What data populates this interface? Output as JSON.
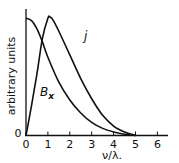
{
  "chart_data": {
    "type": "line",
    "title": "",
    "xlabel": "ν/λ.",
    "ylabel": "arbitrary units",
    "xlim": [
      0,
      6.5
    ],
    "ylim": [
      0,
      1.1
    ],
    "x_ticks": [
      "0",
      "1",
      "2",
      "3",
      "4",
      "5",
      "6"
    ],
    "y_ticks": [
      "0"
    ],
    "grid": false,
    "legend": "inline labels",
    "series": [
      {
        "name": "j",
        "label": "j",
        "x": [
          0,
          0.25,
          0.5,
          0.75,
          1.0,
          1.1,
          1.25,
          1.5,
          2.0,
          2.5,
          3.0,
          3.5,
          4.0,
          4.5,
          5.0
        ],
        "values": [
          0,
          0.25,
          0.52,
          0.82,
          0.99,
          1.0,
          0.97,
          0.88,
          0.68,
          0.48,
          0.31,
          0.17,
          0.08,
          0.03,
          0.0
        ]
      },
      {
        "name": "B_x",
        "label": "B",
        "label_subscript": "x",
        "x": [
          0,
          0.25,
          0.5,
          0.75,
          1.0,
          1.5,
          2.0,
          2.5,
          3.0,
          3.5,
          4.0,
          4.5,
          5.0
        ],
        "values": [
          0.99,
          0.97,
          0.9,
          0.79,
          0.66,
          0.45,
          0.3,
          0.19,
          0.11,
          0.06,
          0.03,
          0.01,
          0.0
        ]
      }
    ]
  },
  "labels": {
    "y_axis_title": "arbitrary units",
    "x_axis_title": "ν/λ.",
    "origin_y": "0",
    "series_j": "j",
    "series_b": "B",
    "series_b_sub": "x"
  }
}
